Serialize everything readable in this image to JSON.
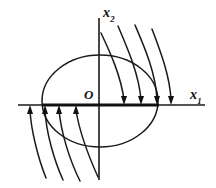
{
  "figure": {
    "kind": "phase-plane-diagram",
    "width": 216,
    "height": 188,
    "background_color": "#ffffff",
    "stroke_color": "#1a1a1a"
  },
  "labels": {
    "x_axis_base": "x",
    "x_axis_subscript": "1",
    "y_axis_base": "x",
    "y_axis_subscript": "2",
    "origin": "O"
  },
  "chart_data": {
    "type": "line",
    "title": "",
    "xlabel": "x1",
    "ylabel": "x2",
    "grid": false,
    "legend": null,
    "axes": {
      "horizontal": {
        "name": "x1-axis",
        "y_px": 105,
        "x_start_px": 18,
        "x_end_px": 205
      },
      "vertical": {
        "name": "x2-axis",
        "x_px": 99,
        "y_start_px": 18,
        "y_end_px": 180
      },
      "origin_px": {
        "x": 99,
        "y": 105
      }
    },
    "equilibrium_segment": {
      "name": "bold-x1-segment",
      "y_px": 105,
      "x_start_px": 42,
      "x_end_px": 159
    },
    "ellipse": {
      "name": "invariant-region-ellipse",
      "cx_px": 100,
      "cy_px": 101,
      "rx_px": 58,
      "ry_px": 46
    },
    "series": [
      {
        "name": "upper-right-trajectories",
        "direction": "downward",
        "arrowhead": "down",
        "count": 4,
        "paths": [
          "M 101 33 C 110 52, 121 76, 124 100",
          "M 118 26 C 127 47, 139 74, 141 100",
          "M 135 25 C 144 46, 156 73, 157 100",
          "M 152 29 C 160 50, 170 76, 171 100"
        ]
      },
      {
        "name": "lower-left-trajectories",
        "direction": "upward",
        "arrowhead": "up",
        "count": 4,
        "paths": [
          "M 46 178 C 38 158, 31 130, 30 110",
          "M 63 180 C 54 160, 46 132, 45 110",
          "M 80 181 C 70 161, 61 133, 59 110",
          "M 98 177 C 89 157, 79 130, 76 110"
        ]
      }
    ],
    "arrow_tips": {
      "down_on_axis_px": [
        124,
        141,
        157,
        171
      ],
      "up_on_axis_px": [
        30,
        45,
        59,
        76
      ]
    }
  }
}
